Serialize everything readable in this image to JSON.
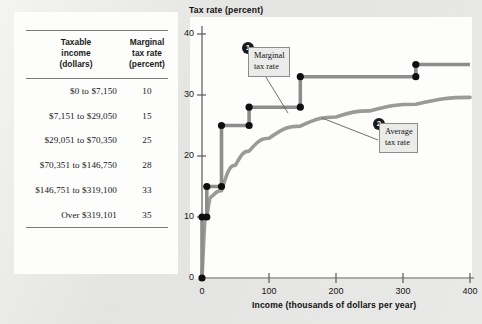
{
  "table": {
    "headers": [
      "Taxable\nincome\n(dollars)",
      "Marginal\ntax rate\n(percent)"
    ],
    "header_col1_line1": "Taxable",
    "header_col1_line2": "income",
    "header_col1_line3": "(dollars)",
    "header_col2_line1": "Marginal",
    "header_col2_line2": "tax rate",
    "header_col2_line3": "(percent)",
    "rows": [
      {
        "income": "$0 to $7,150",
        "rate": "10"
      },
      {
        "income": "$7,151 to $29,050",
        "rate": "15"
      },
      {
        "income": "$29,051 to $70,350",
        "rate": "25"
      },
      {
        "income": "$70,351 to $146,750",
        "rate": "28"
      },
      {
        "income": "$146,751 to $319,100",
        "rate": "33"
      },
      {
        "income": "Over $319,101",
        "rate": "35"
      }
    ]
  },
  "chart_data": {
    "type": "line",
    "title": "",
    "ylabel": "Tax rate (percent)",
    "xlabel": "Income (thousands of dollars per year)",
    "xlim": [
      0,
      400
    ],
    "ylim": [
      0,
      40
    ],
    "xticks": [
      0,
      100,
      200,
      300,
      400
    ],
    "yticks": [
      0,
      10,
      20,
      30,
      40
    ],
    "xtick_labels": [
      "0",
      "100",
      "200",
      "300",
      "400"
    ],
    "ytick_labels": [
      "0",
      "10",
      "20",
      "30",
      "40"
    ],
    "grid": false,
    "legend_position": "annotations",
    "series": [
      {
        "name": "Marginal tax rate",
        "type": "step",
        "color": "#8d8d8b",
        "brackets": [
          {
            "x_start": 0,
            "x_end": 7.15,
            "value": 10
          },
          {
            "x_start": 7.15,
            "x_end": 29.05,
            "value": 15
          },
          {
            "x_start": 29.05,
            "x_end": 70.35,
            "value": 25
          },
          {
            "x_start": 70.35,
            "x_end": 146.75,
            "value": 28
          },
          {
            "x_start": 146.75,
            "x_end": 319.1,
            "value": 33
          },
          {
            "x_start": 319.1,
            "x_end": 400,
            "value": 35
          }
        ],
        "markers": [
          {
            "x": 0,
            "y": 0
          },
          {
            "x": 0,
            "y": 10
          },
          {
            "x": 7.15,
            "y": 10
          },
          {
            "x": 7.15,
            "y": 15
          },
          {
            "x": 29.05,
            "y": 15
          },
          {
            "x": 29.05,
            "y": 25
          },
          {
            "x": 70.35,
            "y": 25
          },
          {
            "x": 70.35,
            "y": 28
          },
          {
            "x": 146.75,
            "y": 28
          },
          {
            "x": 146.75,
            "y": 33
          },
          {
            "x": 319.1,
            "y": 33
          },
          {
            "x": 319.1,
            "y": 35
          }
        ]
      },
      {
        "name": "Average tax rate",
        "type": "curve",
        "color": "#9a9a98",
        "points": [
          {
            "x": 0,
            "y": 0
          },
          {
            "x": 7.15,
            "y": 10.0
          },
          {
            "x": 15,
            "y": 13.4
          },
          {
            "x": 29.05,
            "y": 14.3
          },
          {
            "x": 50,
            "y": 18.5
          },
          {
            "x": 70.35,
            "y": 20.8
          },
          {
            "x": 100,
            "y": 22.9
          },
          {
            "x": 146.75,
            "y": 24.9
          },
          {
            "x": 200,
            "y": 26.4
          },
          {
            "x": 250,
            "y": 27.4
          },
          {
            "x": 319.1,
            "y": 28.5
          },
          {
            "x": 400,
            "y": 29.6
          }
        ]
      }
    ],
    "annotations": [
      {
        "id": "1",
        "label_line1": "Marginal",
        "label_line2": "tax rate"
      },
      {
        "id": "2",
        "label_line1": "Average",
        "label_line2": "tax rate"
      }
    ]
  }
}
